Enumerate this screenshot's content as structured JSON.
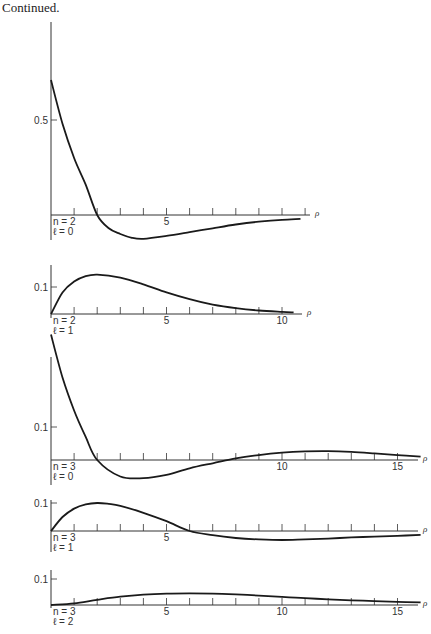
{
  "caption": "Continued.",
  "chart_data": [
    {
      "type": "line",
      "title": "",
      "panel_label": [
        "n = 2",
        "ℓ = 0"
      ],
      "xlabel": "ρ",
      "ylabel": "",
      "x_ticks": [
        5
      ],
      "y_ticks": [
        0.5
      ],
      "xlim": [
        0,
        10.8
      ],
      "ylim": [
        -0.12,
        0.85
      ],
      "x": [
        0,
        0.5,
        1,
        1.5,
        2,
        2.5,
        3,
        3.5,
        4,
        5,
        6,
        7,
        8,
        9,
        10,
        10.8
      ],
      "values": [
        0.71,
        0.48,
        0.3,
        0.16,
        0.0,
        -0.07,
        -0.1,
        -0.12,
        -0.125,
        -0.11,
        -0.09,
        -0.07,
        -0.05,
        -0.035,
        -0.025,
        -0.02
      ]
    },
    {
      "type": "line",
      "panel_label": [
        "n = 2",
        "ℓ = 1"
      ],
      "xlabel": "ρ",
      "x_ticks": [
        5,
        10
      ],
      "y_ticks": [
        0.1
      ],
      "xlim": [
        0,
        10.8
      ],
      "ylim": [
        0,
        0.2
      ],
      "x": [
        0,
        0.5,
        1,
        1.5,
        2,
        3,
        4,
        5,
        6,
        7,
        8,
        9,
        10,
        10.5
      ],
      "values": [
        0.0,
        0.08,
        0.12,
        0.14,
        0.146,
        0.135,
        0.11,
        0.08,
        0.055,
        0.035,
        0.022,
        0.013,
        0.008,
        0.006
      ]
    },
    {
      "type": "line",
      "panel_label": [
        "n = 3",
        "ℓ = 0"
      ],
      "xlabel": "ρ",
      "x_ticks": [
        10,
        15
      ],
      "y_ticks": [
        0.1
      ],
      "xlim": [
        0,
        16
      ],
      "ylim": [
        -0.06,
        0.4
      ],
      "x": [
        0,
        0.5,
        1,
        1.5,
        2,
        3,
        4,
        5,
        6,
        7,
        8,
        9,
        10,
        11,
        12,
        13,
        14,
        15,
        16
      ],
      "values": [
        0.38,
        0.25,
        0.15,
        0.07,
        0.0,
        -0.05,
        -0.055,
        -0.045,
        -0.025,
        -0.01,
        0.005,
        0.015,
        0.022,
        0.026,
        0.027,
        0.025,
        0.02,
        0.015,
        0.01
      ]
    },
    {
      "type": "line",
      "panel_label": [
        "n = 3",
        "ℓ = 1"
      ],
      "xlabel": "ρ",
      "x_ticks": [
        5
      ],
      "y_ticks": [
        0.1
      ],
      "xlim": [
        0,
        16
      ],
      "ylim": [
        -0.05,
        0.12
      ],
      "x": [
        0,
        0.5,
        1,
        1.5,
        2,
        2.5,
        3,
        4,
        5,
        6,
        7,
        8,
        9,
        10,
        11,
        12,
        13,
        14,
        15,
        16
      ],
      "values": [
        0.0,
        0.05,
        0.08,
        0.095,
        0.1,
        0.097,
        0.09,
        0.065,
        0.035,
        0.0,
        -0.015,
        -0.025,
        -0.03,
        -0.032,
        -0.03,
        -0.027,
        -0.023,
        -0.02,
        -0.017,
        -0.014
      ]
    },
    {
      "type": "line",
      "panel_label": [
        "n = 3",
        "ℓ = 2"
      ],
      "xlabel": "ρ",
      "x_ticks": [
        5,
        10,
        15
      ],
      "y_ticks": [
        0.1
      ],
      "xlim": [
        0,
        16
      ],
      "ylim": [
        0,
        0.14
      ],
      "x": [
        0,
        1,
        2,
        3,
        4,
        5,
        6,
        7,
        8,
        9,
        10,
        11,
        12,
        13,
        14,
        15,
        16
      ],
      "values": [
        0.0,
        0.006,
        0.02,
        0.032,
        0.04,
        0.044,
        0.045,
        0.044,
        0.041,
        0.036,
        0.031,
        0.026,
        0.022,
        0.018,
        0.015,
        0.012,
        0.01
      ]
    }
  ]
}
